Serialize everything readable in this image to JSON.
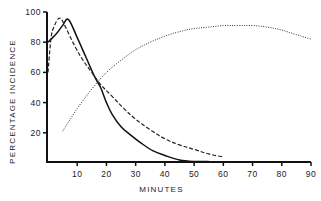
{
  "chart_data": {
    "type": "line",
    "title": "",
    "xlabel": "MINUTES",
    "ylabel": "PERCENTAGE INCIDENCE",
    "xlim": [
      0,
      90
    ],
    "ylim": [
      0,
      100
    ],
    "x_ticks": [
      10,
      20,
      30,
      40,
      50,
      60,
      70,
      80,
      90
    ],
    "y_ticks": [
      20,
      40,
      60,
      80,
      100
    ],
    "grid": false,
    "legend": "none",
    "series": [
      {
        "name": "solid",
        "style": "solid",
        "color": "#111111",
        "points": [
          [
            0,
            80
          ],
          [
            3,
            86
          ],
          [
            5,
            91
          ],
          [
            7,
            95
          ],
          [
            10,
            83
          ],
          [
            13,
            70
          ],
          [
            16,
            57
          ],
          [
            18,
            50
          ],
          [
            20,
            40
          ],
          [
            22,
            32
          ],
          [
            25,
            24
          ],
          [
            28,
            19
          ],
          [
            32,
            13
          ],
          [
            36,
            8
          ],
          [
            40,
            5
          ],
          [
            45,
            2
          ],
          [
            50,
            1
          ],
          [
            55,
            1
          ]
        ]
      },
      {
        "name": "dashed",
        "style": "dashed",
        "color": "#222222",
        "points": [
          [
            0,
            60
          ],
          [
            1,
            82
          ],
          [
            2,
            90
          ],
          [
            4,
            96
          ],
          [
            6,
            90
          ],
          [
            9,
            78
          ],
          [
            12,
            68
          ],
          [
            15,
            60
          ],
          [
            18,
            52
          ],
          [
            22,
            44
          ],
          [
            26,
            36
          ],
          [
            30,
            29
          ],
          [
            35,
            22
          ],
          [
            40,
            16
          ],
          [
            45,
            12
          ],
          [
            50,
            9
          ],
          [
            55,
            6
          ],
          [
            60,
            4
          ]
        ]
      },
      {
        "name": "dotted",
        "style": "dotted",
        "color": "#333333",
        "points": [
          [
            5,
            21
          ],
          [
            10,
            36
          ],
          [
            15,
            49
          ],
          [
            20,
            60
          ],
          [
            25,
            68
          ],
          [
            30,
            75
          ],
          [
            35,
            80
          ],
          [
            40,
            84
          ],
          [
            45,
            87
          ],
          [
            50,
            89
          ],
          [
            55,
            90
          ],
          [
            60,
            91
          ],
          [
            65,
            91
          ],
          [
            70,
            91
          ],
          [
            75,
            90
          ],
          [
            80,
            88
          ],
          [
            85,
            85
          ],
          [
            90,
            82
          ]
        ]
      }
    ]
  }
}
